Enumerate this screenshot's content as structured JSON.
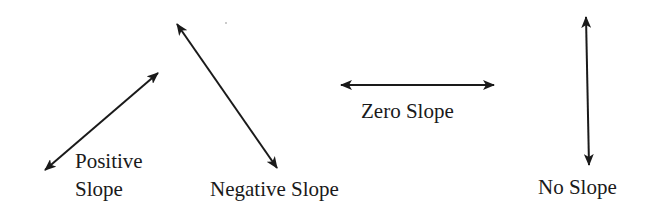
{
  "diagram": {
    "stroke_color": "#1a1a1a",
    "background": "#ffffff",
    "lines": [
      {
        "id": "positive",
        "label_line1": "Positive",
        "label_line2": "Slope",
        "x1": 45,
        "y1": 170,
        "x2": 158,
        "y2": 73
      },
      {
        "id": "negative",
        "label": "Negative Slope",
        "x1": 177,
        "y1": 24,
        "x2": 277,
        "y2": 168
      },
      {
        "id": "zero",
        "label": "Zero Slope",
        "x1": 341,
        "y1": 85,
        "x2": 494,
        "y2": 85
      },
      {
        "id": "none",
        "label": "No Slope",
        "x1": 586,
        "y1": 17,
        "x2": 589,
        "y2": 165
      }
    ]
  }
}
